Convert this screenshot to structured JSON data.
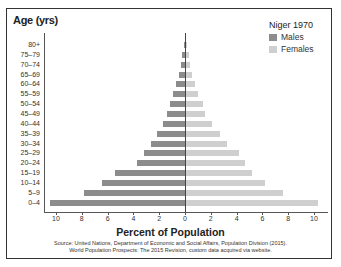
{
  "chart_data": {
    "type": "bar",
    "orientation": "horizontal",
    "subtype": "population-pyramid",
    "title": "Niger 1970",
    "xlabel": "Percent of Population",
    "ylabel": "Age (yrs)",
    "xlim": [
      -10,
      10
    ],
    "x_ticks": [
      "10",
      "8",
      "6",
      "4",
      "2",
      "0",
      "2",
      "4",
      "6",
      "8",
      "10"
    ],
    "categories": [
      "80+",
      "75–79",
      "70–74",
      "65–69",
      "60–64",
      "55–59",
      "50–54",
      "45–49",
      "40–44",
      "35–39",
      "30–34",
      "25–29",
      "20–24",
      "15–19",
      "10–14",
      "5–9",
      "0–4"
    ],
    "series": [
      {
        "name": "Males",
        "color": "#8c8c8c",
        "values": [
          0.1,
          0.2,
          0.3,
          0.5,
          0.7,
          0.9,
          1.2,
          1.4,
          1.7,
          2.2,
          2.6,
          3.2,
          3.7,
          5.4,
          6.4,
          7.8,
          10.5
        ]
      },
      {
        "name": "Females",
        "color": "#cfcfcf",
        "values": [
          0.1,
          0.2,
          0.3,
          0.5,
          0.7,
          0.9,
          1.3,
          1.5,
          2.0,
          2.6,
          3.2,
          4.1,
          4.6,
          5.1,
          6.1,
          7.5,
          10.2
        ]
      }
    ],
    "legend_position": "top-right",
    "grid": false,
    "source": "Source: United Nations, Department of Economic and Social Affairs, Population Division (2015). World Population Prospects: The 2015 Revision, custom data acquired via website."
  },
  "labels": {
    "ylabel": "Age (yrs)",
    "xlabel": "Percent of Population",
    "legend_title": "Niger 1970",
    "legend_males": "Males",
    "legend_females": "Females",
    "source_line1": "Source: United Nations, Department of Economic and Social Affairs, Population Division (2015).",
    "source_line2": "World Population Prospects: The 2015 Revision, custom data acquired via website."
  }
}
